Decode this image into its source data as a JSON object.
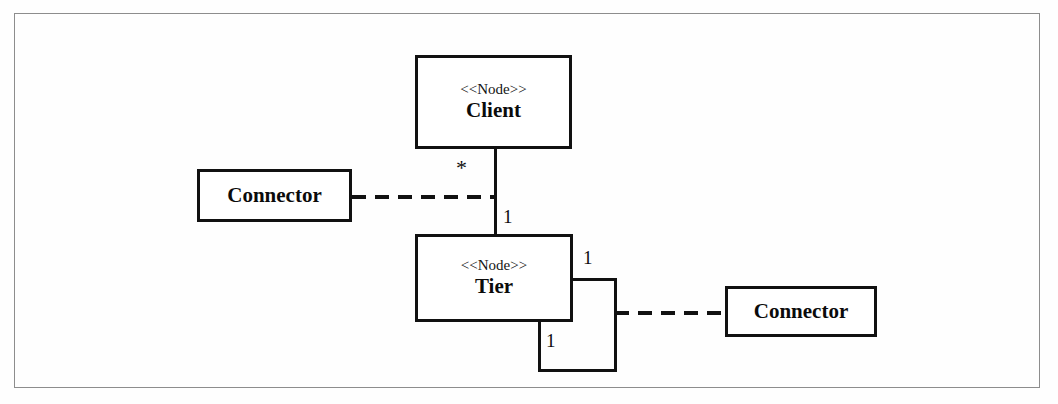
{
  "diagram": {
    "type": "uml-deployment-diagram",
    "nodes": [
      {
        "id": "client",
        "stereotype": "<<Node>>",
        "name": "Client"
      },
      {
        "id": "tier",
        "stereotype": "<<Node>>",
        "name": "Tier"
      }
    ],
    "classes": [
      {
        "id": "connector-left",
        "name": "Connector"
      },
      {
        "id": "connector-right",
        "name": "Connector"
      }
    ],
    "associations": [
      {
        "id": "client-tier",
        "style": "solid",
        "source": "client",
        "target": "tier",
        "source_multiplicity": "*",
        "target_multiplicity": "1"
      },
      {
        "id": "tier-self-loop",
        "style": "solid",
        "source": "tier",
        "target": "tier",
        "source_multiplicity": "1",
        "target_multiplicity": "1"
      }
    ],
    "dependencies": [
      {
        "id": "connector-left-to-client-tier",
        "style": "dashed",
        "source": "connector-left",
        "target": "client-tier"
      },
      {
        "id": "connector-right-to-tier-loop",
        "style": "dashed",
        "source": "tier-self-loop",
        "target": "connector-right"
      }
    ],
    "colors": {
      "line": "#111111",
      "frame": "#8d8d8d",
      "background": "#fefefe",
      "text": "#0b0b0b"
    }
  }
}
